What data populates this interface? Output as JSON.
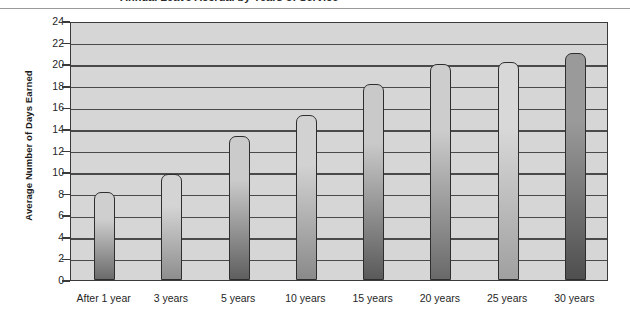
{
  "header": {
    "clipped_title": "Annual Leave Accrual by Years of Service",
    "rule_color": "#9a9a9a"
  },
  "chart_data": {
    "type": "bar",
    "title": "",
    "xlabel": "",
    "ylabel": "Average Number of Days Earned",
    "categories": [
      "After 1 year",
      "3 years",
      "5 years",
      "10 years",
      "15 years",
      "20 years",
      "25 years",
      "30 years"
    ],
    "values": [
      8.2,
      9.8,
      13.3,
      15.3,
      18.2,
      20.0,
      20.2,
      21.0
    ],
    "ylim": [
      0,
      24
    ],
    "ytick_step": 2,
    "yticks": [
      24,
      22,
      20,
      18,
      16,
      14,
      12,
      10,
      8,
      6,
      4,
      2,
      0
    ],
    "grid": true,
    "grid_axis": "y",
    "legend": "none",
    "plot_background": "#d6d6d6",
    "bar_outline_color": "#2e2e2e",
    "bar_gradient_top": "#c8c8c8",
    "bar_gradient_bottom": "#6e6e6e",
    "bar_styles": [
      {
        "top": "#cfcfcf",
        "bottom": "#6b6b6b"
      },
      {
        "top": "#d4d4d4",
        "bottom": "#8e8e8e"
      },
      {
        "top": "#cbcbcb",
        "bottom": "#5f5f5f"
      },
      {
        "top": "#d2d2d2",
        "bottom": "#8a8a8a"
      },
      {
        "top": "#c9c9c9",
        "bottom": "#5a5a5a"
      },
      {
        "top": "#cdcdcd",
        "bottom": "#696969"
      },
      {
        "top": "#d8d8d8",
        "bottom": "#a0a0a0"
      },
      {
        "top": "#9a9a9a",
        "bottom": "#4f4f4f"
      }
    ]
  }
}
